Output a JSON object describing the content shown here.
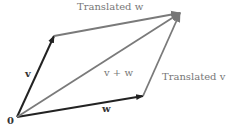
{
  "diagram": {
    "type": "vector-addition-parallelogram",
    "colors": {
      "primary": "#222222",
      "secondary": "#7a7a7a",
      "label_dark": "#333333",
      "label_gray": "#777777"
    },
    "points": {
      "origin": [
        17,
        117
      ],
      "v_tip": [
        54,
        36
      ],
      "w_tip": [
        143,
        96
      ],
      "sum_tip": [
        180,
        13
      ]
    },
    "labels": {
      "origin": "0",
      "v": "v",
      "w": "w",
      "sum": "v + w",
      "translated_w": "Translated w",
      "translated_v": "Translated v"
    }
  }
}
